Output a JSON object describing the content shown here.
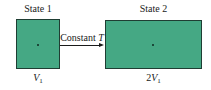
{
  "diagram": {
    "state1": {
      "title": "State 1",
      "volume_symbol": "V",
      "volume_subscript": "1",
      "volume_coefficient": ""
    },
    "state2": {
      "title": "State 2",
      "volume_symbol": "V",
      "volume_subscript": "1",
      "volume_coefficient": "2"
    },
    "process": {
      "label": "Constant",
      "variable": "T"
    },
    "colors": {
      "box_fill": "#45a884",
      "box_border": "#1f3d33",
      "text": "#1a1a1a"
    }
  }
}
